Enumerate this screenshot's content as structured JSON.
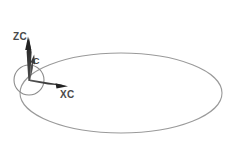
{
  "figure": {
    "kind": "coordinate-frame-on-orbit-diagram",
    "background_color": "#ffffff",
    "labels": {
      "z_axis": "ZC",
      "x_axis": "XC",
      "origin": "C"
    },
    "colors": {
      "orbit_stroke": "#9a9a9a",
      "circle_stroke": "#8c8c8c",
      "arrow_fill": "#2f2f2f",
      "arrow_fill_mid": "#5a5a5a",
      "label_text": "#4a4a4a"
    },
    "geometry": {
      "orbit_ellipse": {
        "cx": 121,
        "cy": 93,
        "rx": 101,
        "ry": 40
      },
      "body_circle": {
        "cx": 29,
        "cy": 80,
        "r": 15
      },
      "origin_point": {
        "x": 30,
        "y": 80
      },
      "z_axis_tip": {
        "x": 28,
        "y": 38
      },
      "x_axis_tip": {
        "x": 67,
        "y": 86
      },
      "y_axis_tip": {
        "x": 33,
        "y": 57
      }
    },
    "label_positions": {
      "z_axis": {
        "x": 13,
        "y": 40
      },
      "x_axis": {
        "x": 60,
        "y": 98
      },
      "origin": {
        "x": 33,
        "y": 64
      }
    }
  }
}
